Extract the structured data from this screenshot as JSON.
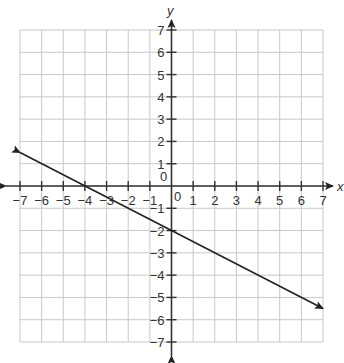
{
  "chart_data": {
    "type": "line",
    "title": "",
    "xlabel": "x",
    "ylabel": "y",
    "xlim": [
      -7,
      7
    ],
    "ylim": [
      -7,
      7
    ],
    "grid": true,
    "x_ticks": [
      -7,
      -6,
      -5,
      -4,
      -3,
      -2,
      -1,
      0,
      1,
      2,
      3,
      4,
      5,
      6,
      7
    ],
    "y_ticks": [
      -7,
      -6,
      -5,
      -4,
      -3,
      -2,
      -1,
      0,
      1,
      2,
      3,
      4,
      5,
      6,
      7
    ],
    "origin_label": "0",
    "series": [
      {
        "name": "line",
        "equation": "y = -0.5x - 2",
        "slope": -0.5,
        "y_intercept": -2,
        "x_intercept": -4,
        "x": [
          -7,
          -4,
          0,
          7
        ],
        "y": [
          1.5,
          0,
          -2,
          -5.5
        ],
        "arrows": "both"
      }
    ],
    "colors": {
      "line": "#222222",
      "grid": "#c8c8c8",
      "axis": "#333333"
    }
  }
}
